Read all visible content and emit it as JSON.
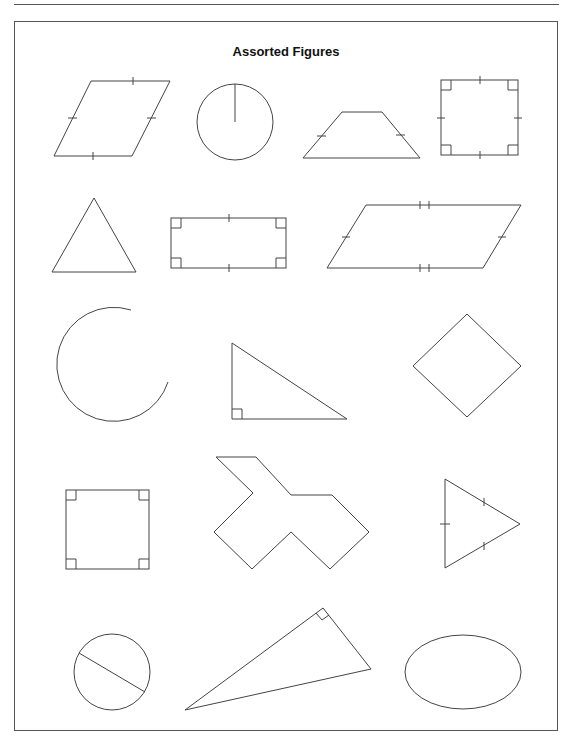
{
  "page": {
    "title": "Assorted Figures"
  },
  "figures": [
    {
      "id": "rhombus-1",
      "type": "rhombus",
      "marks": "single tick on all four sides"
    },
    {
      "id": "circle-radius",
      "type": "circle",
      "marks": "radius drawn"
    },
    {
      "id": "isosceles-trapezoid",
      "type": "trapezoid",
      "marks": "single tick on both legs"
    },
    {
      "id": "square-1",
      "type": "square",
      "marks": "four right-angle boxes, ticks on all sides"
    },
    {
      "id": "triangle-1",
      "type": "triangle",
      "marks": "none"
    },
    {
      "id": "rectangle-1",
      "type": "rectangle",
      "marks": "four right-angle boxes, ticks on top and bottom"
    },
    {
      "id": "parallelogram-1",
      "type": "parallelogram",
      "marks": "double ticks top/bottom, single ticks on sides"
    },
    {
      "id": "arc-1",
      "type": "arc",
      "marks": "none"
    },
    {
      "id": "right-triangle-1",
      "type": "right triangle",
      "marks": "right-angle box"
    },
    {
      "id": "diamond-1",
      "type": "rotated square",
      "marks": "none"
    },
    {
      "id": "square-2",
      "type": "square",
      "marks": "four right-angle boxes"
    },
    {
      "id": "concave-polygon",
      "type": "concave decagon",
      "marks": "none"
    },
    {
      "id": "isosceles-triangle",
      "type": "triangle",
      "marks": "single tick on all three sides"
    },
    {
      "id": "circle-chord",
      "type": "circle",
      "marks": "chord/diameter drawn"
    },
    {
      "id": "right-triangle-2",
      "type": "right triangle",
      "marks": "right-angle box"
    },
    {
      "id": "ellipse-1",
      "type": "ellipse",
      "marks": "none"
    }
  ]
}
